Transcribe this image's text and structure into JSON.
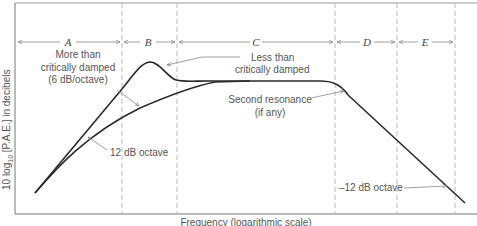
{
  "figure": {
    "y_axis_label": "10 log10 [P.A.E.] in decibels",
    "y_axis_label_parts": {
      "prefix": "10 log",
      "subscript": "10",
      "suffix": " [P.A.E.] in decibels"
    },
    "x_axis_label": "Frequency (logarithmic scale)",
    "regions": [
      {
        "id": "A",
        "label": "A"
      },
      {
        "id": "B",
        "label": "B"
      },
      {
        "id": "C",
        "label": "C"
      },
      {
        "id": "D",
        "label": "D"
      },
      {
        "id": "E",
        "label": "E"
      }
    ],
    "annotations": {
      "more_damped_line1": "More than",
      "more_damped_line2": "critically damped",
      "more_damped_line3": "(6 dB/octave)",
      "less_damped_line1": "Less than",
      "less_damped_line2": "critically damped",
      "second_resonance_line1": "Second resonance",
      "second_resonance_line2": "(if any)",
      "slope_up": "12 dB octave",
      "slope_down": "–12 dB octave"
    },
    "colors": {
      "curve": "#2a2a2a",
      "frame": "#777777",
      "dashed": "#aaaaaa",
      "leader": "#888888",
      "text": "#555555"
    }
  }
}
